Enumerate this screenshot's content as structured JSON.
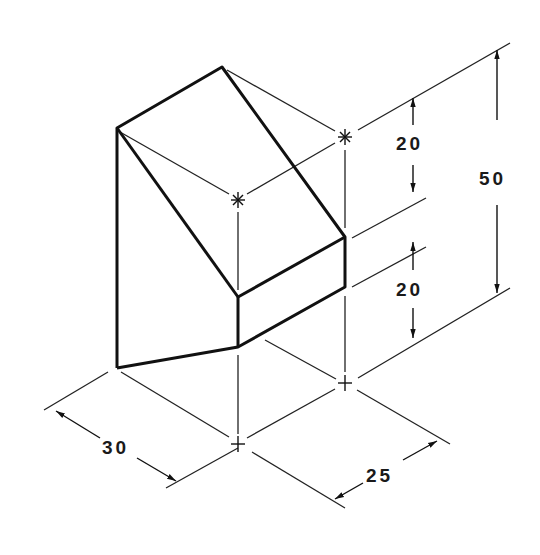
{
  "drawing": {
    "type": "isometric-technical-drawing",
    "line_color": "#111111",
    "background": "#ffffff",
    "dimensions": {
      "height_total": "50",
      "height_upper": "20",
      "height_lower": "20",
      "width": "30",
      "depth": "25"
    }
  }
}
